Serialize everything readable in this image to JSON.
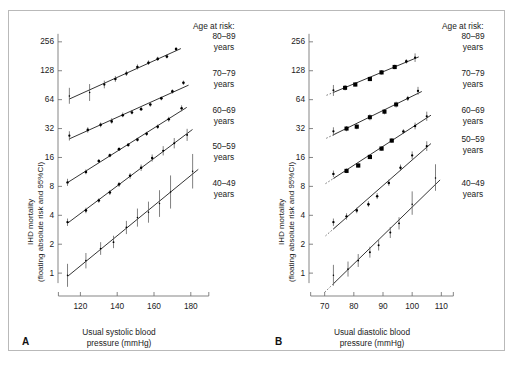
{
  "figure": {
    "y_axis_label_line1": "IHD mortality",
    "y_axis_label_line2": "(floating absolute risk and 95%CI)",
    "legend_title": "Age at risk:",
    "legend_groups": [
      {
        "range": "80–89",
        "unit": "years"
      },
      {
        "range": "70–79",
        "unit": "years"
      },
      {
        "range": "60–69",
        "unit": "years"
      },
      {
        "range": "50–59",
        "unit": "years"
      },
      {
        "range": "40–49",
        "unit": "years"
      }
    ],
    "panels": [
      {
        "letter": "A",
        "x_title_line1": "Usual systolic blood",
        "x_title_line2": "pressure (mmHg)"
      },
      {
        "letter": "B",
        "x_title_line1": "Usual diastolic blood",
        "x_title_line2": "pressure (mmHg)"
      }
    ],
    "colors": {
      "ink": "#111111",
      "axis": "#6f6f6f",
      "frame": "#b9b9b9",
      "error": "#555555"
    }
  },
  "chart_data": [
    {
      "type": "scatter",
      "panel": "A",
      "title": "",
      "xlabel": "Usual systolic blood pressure (mmHg)",
      "ylabel": "IHD mortality (floating absolute risk and 95%CI)",
      "xlim": [
        110,
        185
      ],
      "ylim": [
        0.7,
        340
      ],
      "yscale": "log2",
      "xticks": [
        120,
        140,
        160,
        180
      ],
      "yticks": [
        1,
        2,
        4,
        8,
        16,
        32,
        64,
        128,
        256
      ],
      "grid": false,
      "legend_position": "right",
      "series": [
        {
          "name": "80–89 years",
          "x": [
            114,
            125,
            133,
            139,
            145,
            151,
            157,
            162,
            167,
            172
          ],
          "y": [
            70,
            76,
            92,
            105,
            120,
            140,
            155,
            170,
            180,
            215
          ],
          "ci_low": [
            58,
            62,
            84,
            98,
            113,
            132,
            147,
            162,
            172,
            205
          ],
          "ci_high": [
            85,
            93,
            101,
            113,
            128,
            149,
            164,
            179,
            189,
            226
          ]
        },
        {
          "name": "70–79 years",
          "x": [
            114,
            124,
            131,
            137,
            143,
            148,
            153,
            158,
            164,
            170,
            176
          ],
          "y": [
            27,
            31,
            35,
            38,
            44,
            47,
            51,
            57,
            66,
            78,
            96
          ],
          "ci_low": [
            24,
            29,
            33,
            36,
            42,
            45,
            49,
            54,
            63,
            74,
            91
          ],
          "ci_high": [
            30,
            33,
            37,
            41,
            47,
            50,
            54,
            60,
            69,
            82,
            101
          ]
        },
        {
          "name": "60–69 years",
          "x": [
            113,
            123,
            130,
            136,
            141,
            146,
            151,
            156,
            162,
            168,
            175
          ],
          "y": [
            8.8,
            11.3,
            14.7,
            16.8,
            19.5,
            21.6,
            24.5,
            28.2,
            33.4,
            40.0,
            52.0
          ],
          "ci_low": [
            8.1,
            10.7,
            14.0,
            16.1,
            18.7,
            20.7,
            23.4,
            26.9,
            31.7,
            37.7,
            48.4
          ],
          "ci_high": [
            9.6,
            12.0,
            15.4,
            17.6,
            20.3,
            22.5,
            25.7,
            29.6,
            35.2,
            42.4,
            55.9
          ]
        },
        {
          "name": "50–59 years",
          "x": [
            113,
            123,
            130,
            136,
            141,
            147,
            153,
            159,
            165,
            171,
            178
          ],
          "y": [
            3.4,
            4.5,
            5.7,
            6.9,
            8.4,
            10.3,
            12.5,
            15.8,
            18.8,
            22.5,
            27.5
          ],
          "ci_low": [
            3.1,
            4.2,
            5.4,
            6.5,
            7.9,
            9.6,
            11.6,
            14.5,
            16.8,
            19.9,
            23.8
          ],
          "ci_high": [
            3.7,
            4.8,
            6.0,
            7.3,
            8.9,
            11.0,
            13.5,
            17.2,
            21.0,
            25.5,
            31.8
          ]
        },
        {
          "name": "40–49 years",
          "x": [
            113,
            123,
            131,
            138,
            145,
            151,
            157,
            163,
            169,
            181
          ],
          "y": [
            0.95,
            1.35,
            1.8,
            2.1,
            3.0,
            3.8,
            4.3,
            5.3,
            7.0,
            11.5
          ],
          "ci_low": [
            0.72,
            1.12,
            1.55,
            1.82,
            2.55,
            3.05,
            3.35,
            3.85,
            4.7,
            7.6
          ],
          "ci_high": [
            1.25,
            1.62,
            2.1,
            2.45,
            3.5,
            4.7,
            5.55,
            7.3,
            10.4,
            17.4
          ]
        }
      ]
    },
    {
      "type": "scatter",
      "panel": "B",
      "title": "",
      "xlabel": "Usual diastolic blood pressure (mmHg)",
      "ylabel": "IHD mortality (floating absolute risk and 95%CI)",
      "xlim": [
        66,
        114
      ],
      "ylim": [
        0.7,
        340
      ],
      "yscale": "log2",
      "xticks": [
        70,
        80,
        90,
        100,
        110
      ],
      "yticks": [
        1,
        2,
        4,
        8,
        16,
        32,
        64,
        128,
        256
      ],
      "grid": false,
      "legend_position": "right",
      "series": [
        {
          "name": "80–89 years",
          "x": [
            73,
            77,
            80.5,
            85.5,
            89.5,
            94,
            98,
            101
          ],
          "y": [
            80,
            85,
            92,
            105,
            123,
            140,
            160,
            175
          ],
          "ci_low": [
            70,
            80,
            88,
            100,
            117,
            133,
            152,
            158
          ],
          "ci_high": [
            91,
            91,
            97,
            111,
            130,
            148,
            169,
            194
          ]
        },
        {
          "name": "70–79 years",
          "x": [
            73,
            77.5,
            81,
            85.5,
            90.5,
            94.5,
            98.5,
            102
          ],
          "y": [
            30,
            32,
            33.5,
            42,
            48,
            57,
            66,
            79
          ],
          "ci_low": [
            27,
            30,
            31.5,
            39,
            45,
            53,
            62,
            72
          ],
          "ci_high": [
            33,
            34,
            35.5,
            45,
            51,
            61,
            70,
            87
          ]
        },
        {
          "name": "60–69 years",
          "x": [
            73,
            77.5,
            81.5,
            85.5,
            89.5,
            93,
            97,
            101,
            105
          ],
          "y": [
            10.8,
            11.6,
            13.2,
            16.2,
            19.8,
            24.0,
            29.8,
            34.0,
            43.0
          ],
          "ci_low": [
            10.0,
            11.0,
            12.6,
            15.5,
            18.9,
            22.8,
            28.2,
            31.4,
            38.5
          ],
          "ci_high": [
            11.7,
            12.3,
            13.8,
            16.9,
            20.8,
            25.3,
            31.5,
            36.9,
            48.0
          ]
        },
        {
          "name": "50–59 years",
          "x": [
            73,
            77.5,
            81,
            85,
            88,
            92,
            96,
            100,
            105
          ],
          "y": [
            3.4,
            3.9,
            4.5,
            5.2,
            6.3,
            8.7,
            12.5,
            16.8,
            21.0
          ],
          "ci_low": [
            3.1,
            3.6,
            4.2,
            4.9,
            5.9,
            8.1,
            11.6,
            15.3,
            18.7
          ],
          "ci_high": [
            3.7,
            4.2,
            4.8,
            5.6,
            6.8,
            9.4,
            13.5,
            18.5,
            23.6
          ]
        },
        {
          "name": "40–49 years",
          "x": [
            73,
            78,
            81.5,
            85.5,
            88.5,
            92.5,
            95.5,
            100,
            108
          ],
          "y": [
            0.95,
            1.1,
            1.35,
            1.65,
            1.95,
            2.65,
            3.3,
            5.2,
            9.8
          ],
          "ci_low": [
            0.74,
            0.92,
            1.16,
            1.45,
            1.72,
            2.32,
            2.85,
            4.05,
            7.2
          ],
          "ci_high": [
            1.22,
            1.32,
            1.58,
            1.88,
            2.21,
            3.02,
            3.82,
            7.1,
            13.6
          ]
        }
      ]
    }
  ]
}
